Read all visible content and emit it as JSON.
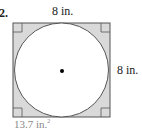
{
  "problem": {
    "number": "2."
  },
  "figure": {
    "shape": "circle inscribed in square",
    "top_side_label": "8 in.",
    "right_side_label": "8 in.",
    "shaded_area_label": "13.7 in.",
    "shaded_area_exponent": "2",
    "colors": {
      "shaded": "#d9d9d9",
      "circle_fill": "#ffffff",
      "stroke": "#555555",
      "center_dot": "#000000",
      "area_label": "#888888"
    }
  }
}
